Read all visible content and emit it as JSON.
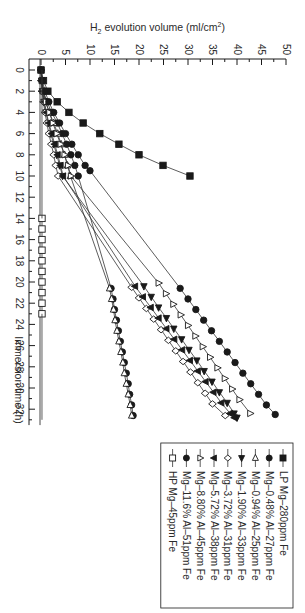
{
  "chart_data": {
    "type": "line",
    "orientation": "rotated-90-clockwise",
    "title": "",
    "xlabel": "Immersion time (h)",
    "ylabel": "H2 evolution volume (ml/cm2)",
    "ylabel_parts": {
      "prefix": "H",
      "sub": "2",
      "middle": " evolution volume (ml/cm",
      "sup": "2",
      "suffix": ")"
    },
    "xlim": [
      -1,
      33.5
    ],
    "ylim": [
      -1,
      50
    ],
    "xticks": [
      0,
      2,
      4,
      6,
      8,
      10,
      12,
      14,
      16,
      18,
      20,
      22,
      24,
      26,
      28,
      30,
      32
    ],
    "yticks": [
      0,
      5,
      10,
      15,
      20,
      25,
      30,
      35,
      40,
      45,
      50
    ],
    "grid": false,
    "legend_position": "upper-left (inside plot, boxed)",
    "series": [
      {
        "name": "LP Mg–280ppm Fe",
        "marker": "square-filled",
        "x": [
          0,
          1,
          2,
          3,
          4,
          5,
          6,
          7,
          8,
          9,
          10
        ],
        "y": [
          0,
          0.5,
          1.4,
          3.3,
          5.7,
          8.6,
          12.0,
          15.9,
          20.0,
          24.9,
          30.4
        ]
      },
      {
        "name": "Mg–0.48% Al–27ppm Fe",
        "marker": "circle-filled",
        "x": [
          0,
          1,
          2,
          3,
          4,
          5,
          6,
          7,
          8,
          9,
          10,
          20.6,
          21.6,
          22.6,
          23.6,
          24.6,
          25.6,
          26.6,
          27.6,
          28.6,
          29.6,
          30.6,
          31.6,
          32.6
        ],
        "y": [
          0,
          0.2,
          0.5,
          1.2,
          2.2,
          3.3,
          4.3,
          5.2,
          6.1,
          6.9,
          7.6,
          14.3,
          14.7,
          15.0,
          15.4,
          15.8,
          16.2,
          16.6,
          17.0,
          17.4,
          17.8,
          18.1,
          18.5,
          18.8
        ]
      },
      {
        "name": "Mg–0.94% Al–25ppm Fe",
        "marker": "triangle-left-open",
        "x": [
          0,
          1,
          2,
          3,
          4,
          5,
          6,
          7,
          8,
          9,
          10,
          20.6,
          21.6,
          22.6,
          23.6,
          24.6,
          25.6,
          26.6,
          27.6,
          28.6,
          29.6,
          30.6,
          31.6,
          32.6
        ],
        "y": [
          0,
          0.2,
          0.4,
          0.9,
          1.7,
          2.6,
          3.4,
          4.1,
          4.8,
          5.4,
          6.0,
          14.0,
          14.4,
          14.8,
          15.1,
          15.5,
          15.9,
          16.3,
          16.7,
          17.0,
          17.4,
          17.8,
          18.2,
          18.5
        ]
      },
      {
        "name": "Mg–1.90% Al–33ppm Fe",
        "marker": "triangle-right-filled",
        "x": [
          0,
          1,
          2,
          3,
          4,
          5,
          6,
          7,
          8,
          9,
          10,
          20.4,
          21.4,
          22.4,
          23.4,
          24.4,
          25.4,
          26.4,
          27.4,
          28.4,
          29.4,
          30.4,
          31.4,
          32.4,
          32.8
        ],
        "y": [
          0,
          0.1,
          0.3,
          0.6,
          1.0,
          1.5,
          2.0,
          2.6,
          3.2,
          3.8,
          4.4,
          21.0,
          22.5,
          24.0,
          25.6,
          27.1,
          28.7,
          30.2,
          31.8,
          33.3,
          34.9,
          36.4,
          38.0,
          39.4,
          40.0
        ]
      },
      {
        "name": "Mg–3.72% Al–31ppm Fe",
        "marker": "diamond-open",
        "x": [
          0,
          1,
          2,
          3,
          4,
          5,
          6,
          7,
          8,
          9,
          10,
          20.5,
          21.5,
          22.5,
          23.5,
          24.5,
          25.5,
          26.5,
          27.5,
          28.5,
          29.5,
          30.5,
          31.5,
          32.6
        ],
        "y": [
          0,
          0.1,
          0.2,
          0.5,
          0.8,
          1.2,
          1.6,
          2.1,
          2.6,
          3.0,
          3.5,
          18.5,
          20.0,
          21.5,
          23.0,
          24.5,
          26.0,
          27.5,
          29.0,
          30.5,
          32.0,
          33.5,
          35.0,
          37.6
        ]
      },
      {
        "name": "Mg–5.72% Al–38ppm Fe",
        "marker": "triangle-down-filled",
        "x": [
          0,
          1,
          2,
          3,
          4,
          5,
          6,
          7,
          8,
          9,
          10,
          20.4,
          21.4,
          22.4,
          23.4,
          24.4,
          25.4,
          26.4,
          27.4,
          28.4,
          29.4,
          30.4,
          31.4,
          32.4,
          32.8
        ],
        "y": [
          0,
          0.1,
          0.3,
          0.7,
          1.1,
          1.6,
          2.2,
          2.8,
          3.4,
          4.0,
          4.5,
          19.2,
          20.8,
          22.4,
          24.0,
          25.6,
          27.2,
          28.8,
          30.4,
          32.0,
          33.6,
          35.2,
          36.8,
          38.6,
          39.5
        ]
      },
      {
        "name": "Mg–8.80% Al–45ppm Fe",
        "marker": "triangle-up-open",
        "x": [
          0,
          1,
          2,
          3,
          4,
          5,
          6,
          7,
          8,
          9,
          10,
          20.1,
          21.1,
          22.1,
          23.1,
          24.1,
          25.1,
          26.1,
          27.1,
          28.1,
          29.1,
          30.1,
          31.1,
          32.4
        ],
        "y": [
          0,
          0.2,
          0.5,
          1.0,
          1.7,
          2.4,
          3.2,
          4.0,
          4.8,
          5.5,
          6.1,
          24.0,
          25.5,
          27.0,
          28.5,
          30.0,
          31.5,
          33.0,
          34.5,
          36.0,
          37.5,
          39.0,
          40.5,
          42.7
        ]
      },
      {
        "name": "Mg–11.6% Al–51ppm Fe",
        "marker": "circle-filled",
        "x": [
          0,
          1,
          2,
          3,
          4,
          5,
          6,
          7,
          8,
          9,
          9.5,
          20.6,
          21.6,
          22.6,
          23.6,
          24.6,
          25.6,
          26.6,
          27.6,
          28.6,
          29.6,
          30.6,
          31.6,
          32.5
        ],
        "y": [
          0,
          0.3,
          0.8,
          1.6,
          2.6,
          3.8,
          5.0,
          6.3,
          7.6,
          9.0,
          10.0,
          28.4,
          30.0,
          31.6,
          33.2,
          34.8,
          36.4,
          38.0,
          39.6,
          41.2,
          42.8,
          44.4,
          46.0,
          47.8
        ]
      },
      {
        "name": "HP Mg–45ppm Fe",
        "marker": "square-open",
        "x": [
          14,
          15,
          16,
          17,
          18,
          19,
          20,
          21,
          22,
          23
        ],
        "y": [
          0.2,
          0.2,
          0.2,
          0.2,
          0.2,
          0.2,
          0.2,
          0.2,
          0.2,
          0.2
        ]
      }
    ]
  },
  "legend": {
    "items": [
      {
        "label": "LP Mg–280ppm Fe",
        "marker": "square-filled"
      },
      {
        "label": "Mg–0.48% Al–27ppm Fe",
        "marker": "circle-filled"
      },
      {
        "label": "Mg–0.94% Al–25ppm Fe",
        "marker": "triangle-left-open"
      },
      {
        "label": "Mg–1.90% Al–33ppm Fe",
        "marker": "triangle-right-filled"
      },
      {
        "label": "Mg–3.72% Al–31ppm Fe",
        "marker": "diamond-open"
      },
      {
        "label": "Mg–5.72% Al–38ppm Fe",
        "marker": "triangle-down-filled"
      },
      {
        "label": "Mg–8.80% Al–45ppm Fe",
        "marker": "triangle-up-open"
      },
      {
        "label": "Mg–11.6% Al–51ppm Fe",
        "marker": "circle-filled"
      },
      {
        "label": "HP Mg–45ppm Fe",
        "marker": "square-open"
      }
    ]
  },
  "colors": {
    "ink": "#1a1a1a",
    "line": "#333333",
    "background": "#ffffff"
  }
}
